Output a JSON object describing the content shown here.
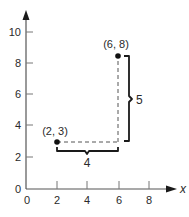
{
  "diagram": {
    "type": "coordinate-plane-distance",
    "x_axis": {
      "name": "x",
      "ticks": [
        "0",
        "2",
        "4",
        "6",
        "8"
      ],
      "range": [
        0,
        9.5
      ]
    },
    "y_axis": {
      "name": "",
      "ticks": [
        "0",
        "2",
        "4",
        "6",
        "8",
        "10"
      ],
      "range": [
        0,
        11
      ]
    },
    "points": [
      {
        "label": "(2, 3)",
        "x": 2,
        "y": 3
      },
      {
        "label": "(6, 8)",
        "x": 6,
        "y": 8
      }
    ],
    "horizontal_distance": {
      "label": "4",
      "from": 2,
      "to": 6
    },
    "vertical_distance": {
      "label": "5",
      "from": 3,
      "to": 8
    },
    "colors": {
      "axis": "#555555",
      "ink": "#1a1a1a",
      "dashed": "#555555"
    }
  }
}
